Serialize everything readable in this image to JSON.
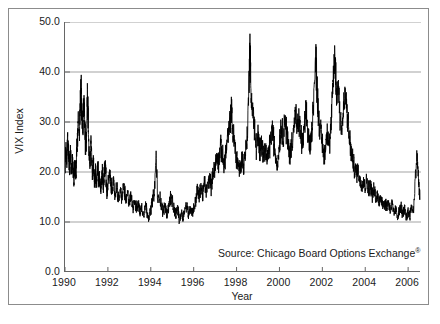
{
  "figure": {
    "background": "#ffffff",
    "frame_color": "#8c8c8c",
    "axis_color": "#666666",
    "grid_color": "#999999",
    "series_color": "#000000"
  },
  "annotation": {
    "source_prefix": "Source: Chicago Board Options Exchange",
    "source_mark": "®"
  },
  "chart_data": {
    "type": "line",
    "title": "",
    "xlabel": "Year",
    "ylabel": "VIX Index",
    "xlim": [
      1990.0,
      2006.6
    ],
    "ylim": [
      0.0,
      50.0
    ],
    "grid": true,
    "grid_axis": "y",
    "legend": "none",
    "yticks": [
      0.0,
      10.0,
      20.0,
      30.0,
      40.0,
      50.0
    ],
    "ytick_labels": [
      "0.0",
      "10.0",
      "20.0",
      "30.0",
      "40.0",
      "50.0"
    ],
    "xticks": [
      1990,
      1992,
      1994,
      1996,
      1998,
      2000,
      2002,
      2004,
      2006
    ],
    "xtick_labels": [
      "1990",
      "1992",
      "1994",
      "1996",
      "1998",
      "2000",
      "2002",
      "2004",
      "2006"
    ],
    "series": [
      {
        "name": "VIX Index",
        "color": "#000000",
        "x": [
          1990.0,
          1990.04,
          1990.08,
          1990.12,
          1990.17,
          1990.21,
          1990.25,
          1990.29,
          1990.33,
          1990.38,
          1990.42,
          1990.46,
          1990.5,
          1990.54,
          1990.58,
          1990.62,
          1990.67,
          1990.71,
          1990.75,
          1990.79,
          1990.83,
          1990.88,
          1990.92,
          1990.96,
          1991.0,
          1991.04,
          1991.08,
          1991.12,
          1991.17,
          1991.21,
          1991.25,
          1991.29,
          1991.33,
          1991.38,
          1991.42,
          1991.46,
          1991.5,
          1991.54,
          1991.58,
          1991.62,
          1991.67,
          1991.71,
          1991.75,
          1991.79,
          1991.83,
          1991.88,
          1991.92,
          1991.96,
          1992.0,
          1992.08,
          1992.17,
          1992.25,
          1992.33,
          1992.42,
          1992.5,
          1992.58,
          1992.67,
          1992.75,
          1992.83,
          1992.92,
          1993.0,
          1993.08,
          1993.17,
          1993.25,
          1993.33,
          1993.42,
          1993.5,
          1993.58,
          1993.67,
          1993.75,
          1993.83,
          1993.92,
          1994.0,
          1994.08,
          1994.17,
          1994.25,
          1994.33,
          1994.42,
          1994.5,
          1994.58,
          1994.67,
          1994.75,
          1994.83,
          1994.92,
          1995.0,
          1995.08,
          1995.17,
          1995.25,
          1995.33,
          1995.42,
          1995.5,
          1995.58,
          1995.67,
          1995.75,
          1995.83,
          1995.92,
          1996.0,
          1996.08,
          1996.17,
          1996.25,
          1996.33,
          1996.42,
          1996.5,
          1996.58,
          1996.67,
          1996.75,
          1996.83,
          1996.92,
          1997.0,
          1997.08,
          1997.17,
          1997.25,
          1997.33,
          1997.42,
          1997.5,
          1997.58,
          1997.67,
          1997.75,
          1997.83,
          1997.92,
          1998.0,
          1998.08,
          1998.17,
          1998.25,
          1998.33,
          1998.42,
          1998.5,
          1998.58,
          1998.62,
          1998.67,
          1998.75,
          1998.83,
          1998.92,
          1999.0,
          1999.08,
          1999.17,
          1999.25,
          1999.33,
          1999.42,
          1999.5,
          1999.58,
          1999.67,
          1999.75,
          1999.83,
          1999.92,
          2000.0,
          2000.08,
          2000.17,
          2000.25,
          2000.33,
          2000.42,
          2000.5,
          2000.58,
          2000.67,
          2000.75,
          2000.83,
          2000.92,
          2001.0,
          2001.08,
          2001.17,
          2001.25,
          2001.33,
          2001.42,
          2001.5,
          2001.58,
          2001.7,
          2001.75,
          2001.83,
          2001.92,
          2002.0,
          2002.08,
          2002.17,
          2002.25,
          2002.33,
          2002.42,
          2002.5,
          2002.58,
          2002.62,
          2002.67,
          2002.75,
          2002.83,
          2002.92,
          2003.0,
          2003.08,
          2003.17,
          2003.25,
          2003.33,
          2003.42,
          2003.5,
          2003.58,
          2003.67,
          2003.75,
          2003.83,
          2003.92,
          2004.0,
          2004.08,
          2004.17,
          2004.25,
          2004.33,
          2004.42,
          2004.5,
          2004.58,
          2004.67,
          2004.75,
          2004.83,
          2004.92,
          2005.0,
          2005.08,
          2005.17,
          2005.25,
          2005.33,
          2005.42,
          2005.5,
          2005.58,
          2005.67,
          2005.75,
          2005.83,
          2005.92,
          2006.0,
          2006.08,
          2006.17,
          2006.25,
          2006.33,
          2006.42,
          2006.5,
          2006.55
        ],
        "y": [
          21.0,
          24.5,
          22.0,
          27.5,
          23.0,
          20.5,
          24.0,
          19.5,
          22.5,
          20.0,
          18.5,
          21.0,
          19.0,
          23.5,
          26.0,
          30.5,
          28.0,
          33.0,
          36.5,
          31.0,
          28.5,
          34.0,
          30.0,
          25.5,
          27.0,
          36.0,
          30.0,
          24.0,
          22.0,
          26.5,
          21.5,
          19.0,
          22.0,
          18.5,
          20.0,
          17.5,
          19.5,
          21.0,
          18.0,
          19.0,
          16.5,
          18.5,
          20.0,
          17.0,
          19.5,
          22.0,
          18.0,
          16.0,
          17.5,
          19.5,
          16.5,
          18.0,
          15.5,
          17.0,
          14.5,
          16.0,
          15.0,
          17.5,
          14.0,
          15.5,
          14.0,
          15.0,
          13.0,
          14.5,
          12.5,
          13.5,
          12.0,
          13.0,
          11.5,
          13.5,
          12.0,
          11.0,
          12.5,
          14.5,
          16.0,
          23.5,
          14.0,
          15.5,
          13.0,
          12.0,
          13.5,
          11.5,
          13.0,
          15.0,
          14.0,
          12.5,
          11.5,
          13.0,
          10.0,
          12.0,
          11.0,
          12.5,
          13.5,
          11.5,
          13.0,
          12.0,
          12.5,
          14.0,
          16.5,
          15.0,
          17.0,
          15.5,
          18.0,
          16.0,
          17.5,
          19.0,
          17.0,
          20.5,
          21.0,
          23.0,
          22.0,
          25.0,
          23.5,
          21.0,
          24.0,
          26.5,
          29.0,
          32.5,
          28.0,
          25.0,
          23.0,
          21.5,
          20.0,
          23.0,
          21.0,
          24.5,
          27.0,
          38.0,
          45.5,
          36.0,
          33.0,
          28.5,
          25.0,
          27.0,
          24.0,
          26.5,
          23.5,
          25.0,
          22.5,
          24.0,
          26.0,
          28.5,
          25.5,
          23.0,
          21.5,
          26.0,
          29.5,
          27.0,
          31.0,
          28.0,
          25.0,
          23.5,
          26.0,
          29.0,
          31.5,
          28.5,
          30.0,
          27.0,
          25.5,
          29.0,
          32.0,
          28.0,
          25.0,
          27.5,
          34.0,
          42.5,
          37.0,
          31.0,
          28.0,
          25.5,
          23.0,
          26.0,
          28.5,
          25.0,
          30.0,
          38.0,
          43.5,
          40.0,
          35.0,
          37.5,
          31.0,
          29.0,
          33.0,
          35.5,
          31.0,
          27.0,
          24.5,
          22.0,
          21.0,
          19.5,
          20.5,
          18.0,
          17.5,
          18.5,
          17.0,
          18.5,
          16.5,
          17.5,
          15.5,
          16.5,
          14.5,
          15.5,
          14.0,
          15.0,
          13.5,
          14.0,
          13.0,
          14.0,
          12.5,
          13.5,
          11.5,
          12.5,
          11.0,
          12.0,
          13.0,
          11.5,
          12.5,
          11.0,
          12.0,
          11.5,
          13.0,
          12.0,
          18.5,
          23.5,
          17.0,
          14.5
        ]
      }
    ]
  }
}
